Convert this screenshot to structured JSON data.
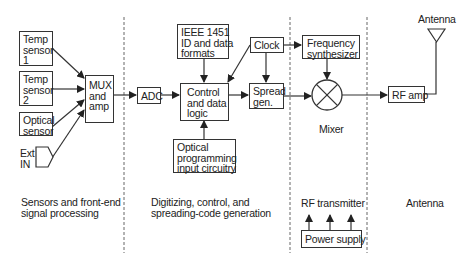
{
  "diagram": {
    "sections": [
      {
        "label": "Sensors and front-end\nsignal processing"
      },
      {
        "label": "Digitizing, control, and\nspreading-code generation"
      },
      {
        "label": "Mixer"
      },
      {
        "label": "RF transmitter"
      },
      {
        "label": "Antenna"
      }
    ],
    "blocks": {
      "temp_sensor_1": "Temp\nsensor\n1",
      "temp_sensor_2": "Temp\nsensor\n2",
      "optical_sensor": "Optical\nsensor",
      "ext_in": "Ext\nIN",
      "mux": "MUX\nand\namp",
      "adc": "ADC",
      "ieee": "IEEE 1451\nID and data\nformats",
      "control": "Control\nand data\nlogic",
      "optical_prog": "Optical\nprogramming\ninput circuitry",
      "clock": "Clock",
      "spread": "Spread\ngen.",
      "freq_synth": "Frequency\nsynthesizer",
      "rf_amp": "RF amp",
      "power_supply": "Power supply",
      "antenna_label": "Antenna"
    },
    "connections": [
      {
        "from": "Temp sensor 1",
        "to": "MUX and amp"
      },
      {
        "from": "Temp sensor 2",
        "to": "MUX and amp"
      },
      {
        "from": "Optical sensor",
        "to": "MUX and amp"
      },
      {
        "from": "Ext IN",
        "to": "MUX and amp"
      },
      {
        "from": "MUX and amp",
        "to": "ADC"
      },
      {
        "from": "ADC",
        "to": "Control and data logic"
      },
      {
        "from": "IEEE 1451 ID and data formats",
        "to": "Control and data logic"
      },
      {
        "from": "Optical programming input circuitry",
        "to": "Control and data logic"
      },
      {
        "from": "Clock",
        "to": "Control and data logic"
      },
      {
        "from": "Clock",
        "to": "Spread gen."
      },
      {
        "from": "Clock",
        "to": "Frequency synthesizer"
      },
      {
        "from": "Control and data logic",
        "to": "Spread gen."
      },
      {
        "from": "Spread gen.",
        "to": "Mixer"
      },
      {
        "from": "Frequency synthesizer",
        "to": "Mixer"
      },
      {
        "from": "Mixer",
        "to": "RF amp"
      },
      {
        "from": "RF amp",
        "to": "Antenna"
      },
      {
        "from": "Power supply",
        "to": "RF transmitter"
      }
    ],
    "colors": {
      "line": "#333333",
      "background": "#ffffff",
      "divider": "#666666"
    }
  }
}
